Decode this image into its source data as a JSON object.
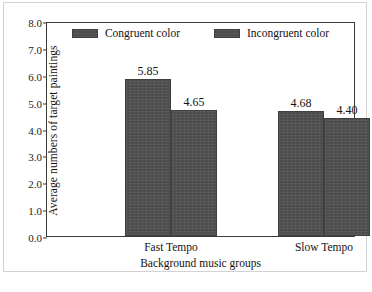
{
  "chart_data": {
    "type": "bar",
    "title": "",
    "xlabel": "Background music groups",
    "ylabel": "Average numbers of target paintings",
    "categories": [
      "Fast Tempo",
      "Slow Tempo"
    ],
    "series": [
      {
        "name": "Congruent color",
        "values": [
          5.85,
          4.65
        ],
        "color": "#4d4d4d"
      },
      {
        "name": "Incongruent color",
        "values": [
          4.68,
          4.4
        ],
        "color": "#4d4d4d"
      }
    ],
    "bars": [
      {
        "group": "Fast Tempo",
        "series": "Congruent color",
        "value": 5.85,
        "label": "5.85"
      },
      {
        "group": "Fast Tempo",
        "series": "Incongruent color",
        "value": 4.65,
        "label": "4.65"
      },
      {
        "group": "Slow Tempo",
        "series": "Congruent color",
        "value": 4.68,
        "label": "4.68"
      },
      {
        "group": "Slow Tempo",
        "series": "Incongruent color",
        "value": 4.4,
        "label": "4.40"
      }
    ],
    "ylim": [
      0.0,
      8.0
    ],
    "ytick_labels": [
      "8.0",
      "7.0",
      "6.0",
      "5.0",
      "4.0",
      "3.0",
      "2.0",
      "1.0",
      "0.0"
    ],
    "ytick_values": [
      8.0,
      7.0,
      6.0,
      5.0,
      4.0,
      3.0,
      2.0,
      1.0,
      0.0
    ],
    "grid": false,
    "legend_position": "top-center",
    "legend": [
      {
        "label": "Congruent color",
        "swatch": "legend-swatch-congruent"
      },
      {
        "label": "Incongruent color",
        "swatch": "legend-swatch-incongruent"
      }
    ],
    "frame_color": "#3a3a3a",
    "bar_color": "#4d4d4d",
    "background_color": "#ffffff"
  }
}
